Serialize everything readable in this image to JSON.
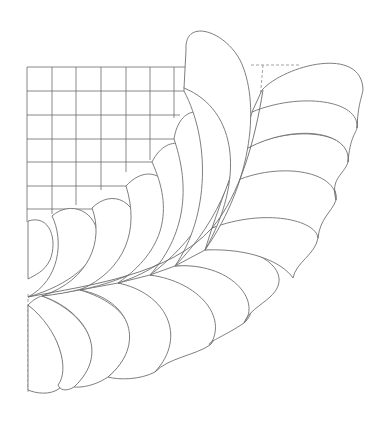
{
  "figure": {
    "subject": "Quilting feather corner pattern",
    "stroke_color": "#707070",
    "background_color": "#ffffff",
    "grid": {
      "columns": 7,
      "rows": 7,
      "origin_x": 27,
      "origin_y": 67,
      "cell_size": 24
    },
    "feather_groups": [
      {
        "name": "upper-inner-plumes",
        "count": 7
      },
      {
        "name": "upper-outer-plumes",
        "count": 5
      },
      {
        "name": "lower-plumes",
        "count": 7
      }
    ],
    "guides": [
      "top-right-dashed-guide",
      "left-dashed-guide"
    ]
  }
}
